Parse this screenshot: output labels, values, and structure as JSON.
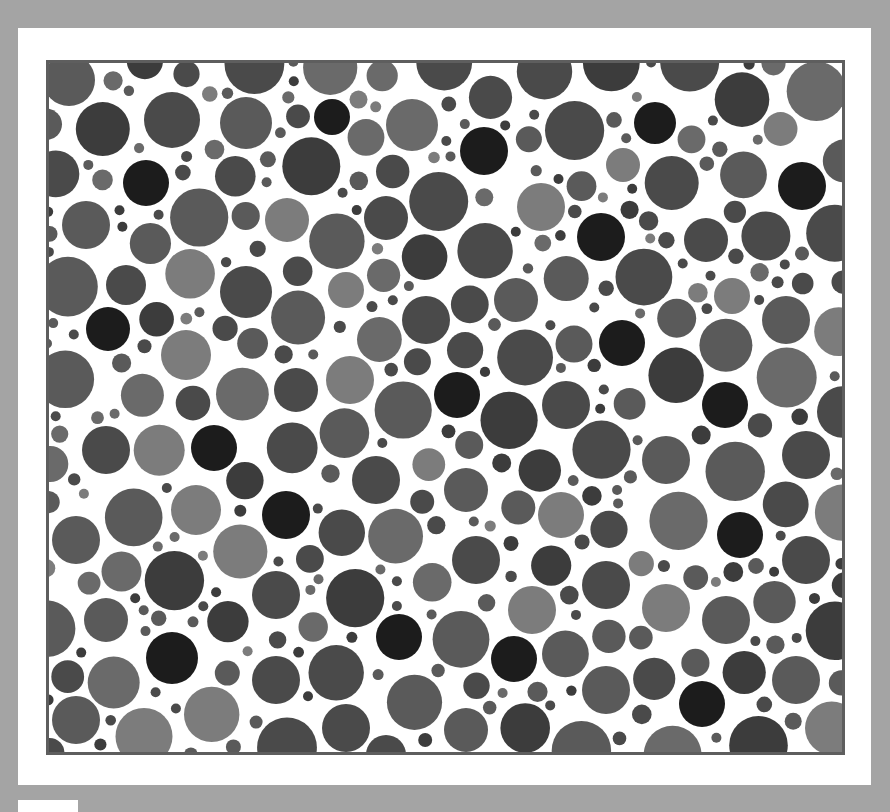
{
  "image": {
    "kind": "grayscale dot-pattern color-vision test plate",
    "caption": "Pseudoisochromatic dot plate",
    "background_color": "#a4a4a4",
    "frame_color": "#ffffff",
    "plate_border_color": "#5e5e5e",
    "plate_fill_color": "#ffffff"
  },
  "palette": {
    "darkest": "#1c1c1c",
    "dark": "#3c3c3c",
    "mid_dark": "#4a4a4a",
    "mid": "#5a5a5a",
    "mid_light": "#6a6a6a",
    "light": "#7c7c7c"
  },
  "plate": {
    "width": 799,
    "height": 695,
    "offset_x": 46,
    "offset_y": 60,
    "seed": 1337,
    "fill_attempts": 9000,
    "min_radius": 5,
    "max_radius": 30,
    "gap": 3,
    "featured_dots": [
      {
        "x": 286,
        "y": 57,
        "r": 18,
        "tone": "darkest"
      },
      {
        "x": 438,
        "y": 91,
        "r": 24,
        "tone": "darkest"
      },
      {
        "x": 609,
        "y": 63,
        "r": 21,
        "tone": "darkest"
      },
      {
        "x": 100,
        "y": 123,
        "r": 23,
        "tone": "darkest"
      },
      {
        "x": 756,
        "y": 126,
        "r": 24,
        "tone": "darkest"
      },
      {
        "x": 555,
        "y": 177,
        "r": 24,
        "tone": "darkest"
      },
      {
        "x": 62,
        "y": 269,
        "r": 22,
        "tone": "darkest"
      },
      {
        "x": 576,
        "y": 283,
        "r": 23,
        "tone": "darkest"
      },
      {
        "x": 411,
        "y": 335,
        "r": 23,
        "tone": "darkest"
      },
      {
        "x": 679,
        "y": 345,
        "r": 23,
        "tone": "darkest"
      },
      {
        "x": 168,
        "y": 388,
        "r": 23,
        "tone": "darkest"
      },
      {
        "x": 240,
        "y": 455,
        "r": 24,
        "tone": "darkest"
      },
      {
        "x": 694,
        "y": 475,
        "r": 23,
        "tone": "darkest"
      },
      {
        "x": 126,
        "y": 598,
        "r": 26,
        "tone": "darkest"
      },
      {
        "x": 353,
        "y": 577,
        "r": 23,
        "tone": "darkest"
      },
      {
        "x": 468,
        "y": 599,
        "r": 23,
        "tone": "darkest"
      },
      {
        "x": 656,
        "y": 644,
        "r": 23,
        "tone": "darkest"
      },
      {
        "x": 23,
        "y": 20,
        "r": 26,
        "tone": "mid"
      },
      {
        "x": 126,
        "y": 60,
        "r": 28,
        "tone": "mid_dark"
      },
      {
        "x": 200,
        "y": 63,
        "r": 26,
        "tone": "mid"
      },
      {
        "x": 366,
        "y": 65,
        "r": 26,
        "tone": "mid_light"
      },
      {
        "x": 241,
        "y": 160,
        "r": 22,
        "tone": "light"
      },
      {
        "x": 495,
        "y": 147,
        "r": 24,
        "tone": "light"
      },
      {
        "x": 140,
        "y": 295,
        "r": 25,
        "tone": "light"
      },
      {
        "x": 304,
        "y": 320,
        "r": 24,
        "tone": "light"
      },
      {
        "x": 150,
        "y": 450,
        "r": 25,
        "tone": "light"
      },
      {
        "x": 515,
        "y": 455,
        "r": 23,
        "tone": "light"
      },
      {
        "x": 486,
        "y": 550,
        "r": 24,
        "tone": "light"
      },
      {
        "x": 620,
        "y": 548,
        "r": 24,
        "tone": "light"
      },
      {
        "x": 686,
        "y": 236,
        "r": 18,
        "tone": "light"
      },
      {
        "x": 577,
        "y": 105,
        "r": 17,
        "tone": "light"
      },
      {
        "x": 300,
        "y": 230,
        "r": 18,
        "tone": "light"
      },
      {
        "x": 340,
        "y": 158,
        "r": 22,
        "tone": "mid_dark"
      },
      {
        "x": 40,
        "y": 165,
        "r": 24,
        "tone": "mid"
      },
      {
        "x": 80,
        "y": 225,
        "r": 20,
        "tone": "mid_dark"
      },
      {
        "x": 200,
        "y": 232,
        "r": 26,
        "tone": "mid_dark"
      },
      {
        "x": 380,
        "y": 260,
        "r": 24,
        "tone": "mid_dark"
      },
      {
        "x": 470,
        "y": 240,
        "r": 22,
        "tone": "mid"
      },
      {
        "x": 660,
        "y": 180,
        "r": 22,
        "tone": "mid_dark"
      },
      {
        "x": 740,
        "y": 260,
        "r": 24,
        "tone": "mid"
      },
      {
        "x": 250,
        "y": 330,
        "r": 22,
        "tone": "mid_dark"
      },
      {
        "x": 520,
        "y": 345,
        "r": 24,
        "tone": "mid_dark"
      },
      {
        "x": 620,
        "y": 400,
        "r": 24,
        "tone": "mid"
      },
      {
        "x": 760,
        "y": 395,
        "r": 24,
        "tone": "mid_dark"
      },
      {
        "x": 60,
        "y": 390,
        "r": 24,
        "tone": "mid_dark"
      },
      {
        "x": 330,
        "y": 420,
        "r": 24,
        "tone": "mid_dark"
      },
      {
        "x": 420,
        "y": 430,
        "r": 22,
        "tone": "mid"
      },
      {
        "x": 30,
        "y": 480,
        "r": 24,
        "tone": "mid"
      },
      {
        "x": 430,
        "y": 500,
        "r": 24,
        "tone": "mid_dark"
      },
      {
        "x": 760,
        "y": 500,
        "r": 24,
        "tone": "mid_dark"
      },
      {
        "x": 60,
        "y": 560,
        "r": 22,
        "tone": "mid"
      },
      {
        "x": 230,
        "y": 535,
        "r": 24,
        "tone": "mid_dark"
      },
      {
        "x": 560,
        "y": 525,
        "r": 24,
        "tone": "mid_dark"
      },
      {
        "x": 680,
        "y": 560,
        "r": 24,
        "tone": "mid"
      },
      {
        "x": 230,
        "y": 620,
        "r": 24,
        "tone": "mid_dark"
      },
      {
        "x": 560,
        "y": 630,
        "r": 24,
        "tone": "mid"
      },
      {
        "x": 750,
        "y": 620,
        "r": 24,
        "tone": "mid"
      },
      {
        "x": 30,
        "y": 660,
        "r": 24,
        "tone": "mid"
      },
      {
        "x": 300,
        "y": 668,
        "r": 24,
        "tone": "mid_dark"
      },
      {
        "x": 420,
        "y": 670,
        "r": 22,
        "tone": "mid"
      }
    ],
    "tone_weights": {
      "mid_dark": 0.33,
      "mid": 0.3,
      "dark": 0.17,
      "mid_light": 0.14,
      "light": 0.06
    }
  }
}
